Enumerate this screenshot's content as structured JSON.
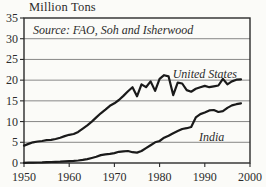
{
  "page": {
    "title": "Million Tons"
  },
  "chart_data": {
    "type": "line",
    "title": "Million Tons",
    "source_annotation": "Source: FAO, Soh and Isherwood",
    "xlabel": "",
    "ylabel": "Million Tons",
    "x": [
      1950,
      1951,
      1952,
      1953,
      1954,
      1955,
      1956,
      1957,
      1958,
      1959,
      1960,
      1961,
      1962,
      1963,
      1964,
      1965,
      1966,
      1967,
      1968,
      1969,
      1970,
      1971,
      1972,
      1973,
      1974,
      1975,
      1976,
      1977,
      1978,
      1979,
      1980,
      1981,
      1982,
      1983,
      1984,
      1985,
      1986,
      1987,
      1988,
      1989,
      1990,
      1991,
      1992,
      1993,
      1994,
      1995,
      1996,
      1997,
      1998
    ],
    "series": [
      {
        "name": "United States",
        "values": [
          4.2,
          4.6,
          5.0,
          5.2,
          5.3,
          5.5,
          5.6,
          5.8,
          6.1,
          6.5,
          6.8,
          7.0,
          7.5,
          8.3,
          9.1,
          10.0,
          11.0,
          12.0,
          12.9,
          13.8,
          14.4,
          15.2,
          16.2,
          17.3,
          18.3,
          16.1,
          19.0,
          18.3,
          19.7,
          17.4,
          20.3,
          21.2,
          20.9,
          16.4,
          19.4,
          19.2,
          17.6,
          17.2,
          17.9,
          18.3,
          18.6,
          18.3,
          18.5,
          18.7,
          20.3,
          19.0,
          19.7,
          20.1,
          20.2
        ],
        "label": {
          "x": 1990,
          "y": 21.5
        }
      },
      {
        "name": "India",
        "values": [
          0.06,
          0.08,
          0.1,
          0.12,
          0.15,
          0.2,
          0.25,
          0.3,
          0.35,
          0.4,
          0.45,
          0.5,
          0.6,
          0.75,
          0.95,
          1.2,
          1.5,
          1.9,
          2.1,
          2.2,
          2.4,
          2.7,
          2.8,
          2.9,
          2.6,
          2.5,
          2.9,
          3.6,
          4.3,
          5.0,
          5.3,
          6.1,
          6.6,
          7.2,
          7.7,
          8.2,
          8.4,
          8.7,
          11.0,
          11.8,
          12.2,
          12.7,
          12.8,
          12.3,
          12.5,
          13.3,
          13.9,
          14.2,
          14.4
        ],
        "label": {
          "x": 1991.5,
          "y": 6.3
        }
      }
    ],
    "xlim": [
      1950,
      2000
    ],
    "ylim": [
      0,
      35
    ],
    "xticks": [
      1950,
      1960,
      1970,
      1980,
      1990,
      2000
    ],
    "yticks": [
      0,
      5,
      10,
      15,
      20,
      25,
      30,
      35
    ],
    "grid": true,
    "legend_position": "inline-annotations",
    "colors": {
      "line": "#1a1a1a",
      "grid": "#6a6a6a",
      "border": "#2b2b2b",
      "text": "#2b2b2b",
      "background": "#fbfbf8"
    }
  }
}
